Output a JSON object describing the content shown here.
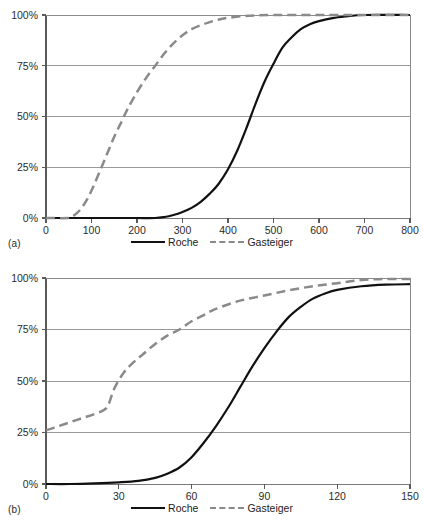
{
  "figure": {
    "background": "#ffffff",
    "series_colors": {
      "roche": "#111111",
      "gasteiger": "#8a8a8a"
    }
  },
  "panels": [
    {
      "id": "a",
      "label": "(a)",
      "legend": [
        {
          "name": "Roche",
          "style": "solid"
        },
        {
          "name": "Gasteiger",
          "style": "dashed"
        }
      ],
      "axis": {
        "x_ticks": [
          "0",
          "100",
          "200",
          "300",
          "400",
          "500",
          "600",
          "700",
          "800"
        ],
        "y_ticks": [
          "0%",
          "25%",
          "50%",
          "75%",
          "100%"
        ]
      }
    },
    {
      "id": "b",
      "label": "(b)",
      "legend": [
        {
          "name": "Roche",
          "style": "solid"
        },
        {
          "name": "Gasteiger",
          "style": "dashed"
        }
      ],
      "axis": {
        "x_ticks": [
          "0",
          "30",
          "60",
          "90",
          "120",
          "150"
        ],
        "y_ticks": [
          "0%",
          "25%",
          "50%",
          "75%",
          "100%"
        ]
      }
    }
  ],
  "chart_data": [
    {
      "type": "line",
      "title": "",
      "subtitle": "(a)",
      "xlabel": "",
      "ylabel": "",
      "xlim": [
        0,
        800
      ],
      "ylim": [
        0,
        100
      ],
      "xticks": [
        0,
        100,
        200,
        300,
        400,
        500,
        600,
        700,
        800
      ],
      "yticks": [
        0,
        25,
        50,
        75,
        100
      ],
      "ytick_labels": [
        "0%",
        "25%",
        "50%",
        "75%",
        "100%"
      ],
      "grid": "horizontal",
      "legend_position": "bottom",
      "series": [
        {
          "name": "Roche",
          "style": "solid",
          "color": "#111111",
          "x": [
            0,
            50,
            100,
            150,
            200,
            240,
            260,
            280,
            300,
            320,
            340,
            360,
            380,
            400,
            420,
            440,
            460,
            480,
            500,
            520,
            540,
            560,
            580,
            600,
            630,
            660,
            700,
            800
          ],
          "y": [
            0,
            0,
            0,
            0,
            0,
            0,
            0.5,
            1.5,
            3,
            5,
            8,
            12,
            17,
            24,
            33,
            44,
            56,
            67,
            76,
            84,
            89,
            93,
            95.5,
            97,
            98.5,
            99.3,
            100,
            100
          ]
        },
        {
          "name": "Gasteiger",
          "style": "dashed",
          "color": "#8a8a8a",
          "x": [
            0,
            50,
            60,
            75,
            90,
            105,
            120,
            135,
            150,
            165,
            180,
            200,
            220,
            240,
            260,
            280,
            300,
            320,
            340,
            360,
            380,
            400,
            430,
            460,
            500,
            600,
            700,
            800
          ],
          "y": [
            0,
            0,
            1,
            4,
            9,
            16,
            24,
            32,
            40,
            47,
            54,
            62,
            69,
            75,
            81,
            86,
            90,
            93,
            95,
            96.5,
            97.8,
            98.6,
            99.4,
            99.8,
            100,
            100,
            100,
            100
          ]
        }
      ]
    },
    {
      "type": "line",
      "title": "",
      "subtitle": "(b)",
      "xlabel": "",
      "ylabel": "",
      "xlim": [
        0,
        150
      ],
      "ylim": [
        0,
        100
      ],
      "xticks": [
        0,
        30,
        60,
        90,
        120,
        150
      ],
      "yticks": [
        0,
        25,
        50,
        75,
        100
      ],
      "ytick_labels": [
        "0%",
        "25%",
        "50%",
        "75%",
        "100%"
      ],
      "grid": "horizontal",
      "legend_position": "bottom",
      "series": [
        {
          "name": "Roche",
          "style": "solid",
          "color": "#111111",
          "x": [
            0,
            10,
            20,
            30,
            38,
            45,
            50,
            55,
            60,
            65,
            70,
            75,
            80,
            85,
            90,
            95,
            100,
            105,
            110,
            115,
            120,
            130,
            140,
            150
          ],
          "y": [
            0,
            0,
            0.3,
            0.8,
            1.5,
            3,
            5,
            8,
            13,
            20,
            28,
            37,
            47,
            57,
            66,
            74,
            81,
            86,
            90,
            92.5,
            94.2,
            96,
            96.8,
            97
          ]
        },
        {
          "name": "Gasteiger",
          "style": "dashed",
          "color": "#8a8a8a",
          "x": [
            0,
            5,
            10,
            15,
            20,
            25,
            28,
            32,
            36,
            40,
            45,
            50,
            55,
            60,
            65,
            70,
            80,
            90,
            100,
            110,
            120,
            130,
            140,
            150
          ],
          "y": [
            26,
            28,
            30,
            32,
            34,
            37,
            46,
            54,
            59,
            63,
            68,
            72,
            75,
            79,
            82,
            85,
            89,
            91.5,
            94,
            96,
            97.5,
            99,
            99.5,
            99.5
          ]
        }
      ]
    }
  ]
}
